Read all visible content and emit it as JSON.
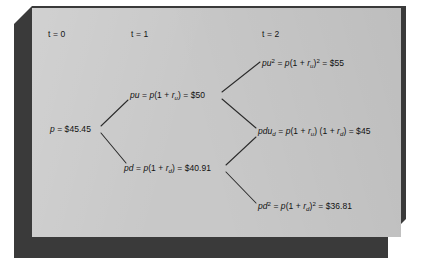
{
  "figure": {
    "type": "binomial-price-tree",
    "style": {
      "panel_color": "#c8c8c8",
      "slab_color": "#3a3a3a",
      "background_color": "#ffffff",
      "text_color": "#111111",
      "line_color": "#2b2b2b"
    },
    "period_labels": [
      {
        "name": "t0",
        "text": "t = 0"
      },
      {
        "name": "t1",
        "text": "t = 1"
      },
      {
        "name": "t2",
        "text": "t = 2"
      }
    ],
    "nodes": {
      "root": {
        "id": "p",
        "period": 0,
        "value": "$45.45",
        "text_html": "<i>p</i> = $45.45"
      },
      "up": {
        "id": "pu",
        "period": 1,
        "value": "$50",
        "text_html": "<i>pu</i> = <i>p</i>(1 + <i>r</i><span class=\"sub\">u</span>) = $50"
      },
      "down": {
        "id": "pd",
        "period": 1,
        "value": "$40.91",
        "text_html": "<i>pd</i> = <i>p</i>(1 + <i>r</i><span class=\"sub\">d</span>) = $40.91"
      },
      "up_up": {
        "id": "pu2",
        "period": 2,
        "value": "$55",
        "text_html": "<i>pu</i><span class=\"sup\">2</span> = <i>p</i>(1 + <i>r</i><span class=\"sub\">u</span>)<span class=\"sup\">2</span> = $55"
      },
      "up_down": {
        "id": "pdud",
        "period": 2,
        "value": "$45",
        "text_html": "<i>pdu</i><span class=\"sub\">d</span> = <i>p</i>(1 + <i>r</i><span class=\"sub\">u</span>) (1 + <i>r</i><span class=\"sub\">d</span>) = $45"
      },
      "down_down": {
        "id": "pd2",
        "period": 2,
        "value": "$36.81",
        "text_html": "<i>pd</i><span class=\"sup\">2</span> = <i>p</i>(1 + <i>r</i><span class=\"sub\">d</span>)<span class=\"sup\">2</span> = $36.81"
      }
    }
  }
}
